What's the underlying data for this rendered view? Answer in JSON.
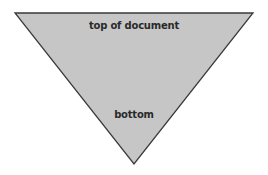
{
  "diagram": {
    "shape": "inverted-triangle",
    "fill_color": "#c6c6c6",
    "stroke_color": "#3a3a3a",
    "labels": {
      "top": "top of document",
      "bottom": "bottom"
    }
  }
}
